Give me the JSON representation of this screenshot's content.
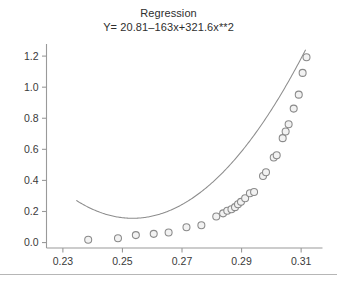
{
  "chart_data": {
    "type": "scatter",
    "title": "Regression",
    "subtitle": "Y= 20.81–163x+321.6x**2",
    "xlabel": "",
    "ylabel": "",
    "xlim": [
      0.2245,
      0.3165
    ],
    "ylim": [
      -0.035,
      1.265
    ],
    "grid": false,
    "legend": null,
    "xticks": [
      0.23,
      0.25,
      0.27,
      0.29,
      0.31
    ],
    "xtick_labels": [
      "0.23",
      "0.25",
      "0.27",
      "0.29",
      "0.31"
    ],
    "yticks": [
      0.0,
      0.2,
      0.4,
      0.6,
      0.8,
      1.0,
      1.2
    ],
    "ytick_labels": [
      "0.0",
      "0.2",
      "0.4",
      "0.6",
      "0.8",
      "1.0",
      "1.2"
    ],
    "marker": "open-circle",
    "marker_color": "#8a8a8a",
    "curve_color": "#8d8d8d",
    "fit": {
      "equation": "Y= 20.81–163x+321.6x**2",
      "intercept": 20.81,
      "linear_coefficient": -163,
      "quadratic_coefficient": 321.6,
      "x_start": 0.2345,
      "x_end": 0.3115
    },
    "points": [
      {
        "x": 0.2385,
        "y": 0.018
      },
      {
        "x": 0.2485,
        "y": 0.028
      },
      {
        "x": 0.2545,
        "y": 0.048
      },
      {
        "x": 0.2605,
        "y": 0.056
      },
      {
        "x": 0.2655,
        "y": 0.065
      },
      {
        "x": 0.2715,
        "y": 0.098
      },
      {
        "x": 0.2765,
        "y": 0.112
      },
      {
        "x": 0.2815,
        "y": 0.168
      },
      {
        "x": 0.2838,
        "y": 0.188
      },
      {
        "x": 0.2852,
        "y": 0.205
      },
      {
        "x": 0.2866,
        "y": 0.215
      },
      {
        "x": 0.2878,
        "y": 0.228
      },
      {
        "x": 0.2888,
        "y": 0.246
      },
      {
        "x": 0.2898,
        "y": 0.262
      },
      {
        "x": 0.2912,
        "y": 0.285
      },
      {
        "x": 0.2928,
        "y": 0.318
      },
      {
        "x": 0.2942,
        "y": 0.325
      },
      {
        "x": 0.2972,
        "y": 0.428
      },
      {
        "x": 0.2982,
        "y": 0.452
      },
      {
        "x": 0.3008,
        "y": 0.548
      },
      {
        "x": 0.3018,
        "y": 0.562
      },
      {
        "x": 0.3038,
        "y": 0.672
      },
      {
        "x": 0.3048,
        "y": 0.715
      },
      {
        "x": 0.3058,
        "y": 0.762
      },
      {
        "x": 0.3075,
        "y": 0.862
      },
      {
        "x": 0.3092,
        "y": 0.952
      },
      {
        "x": 0.3105,
        "y": 1.092
      },
      {
        "x": 0.3118,
        "y": 1.192
      }
    ]
  }
}
